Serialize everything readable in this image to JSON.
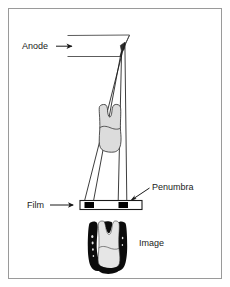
{
  "figure": {
    "background_color": "#ffffff",
    "frame_color": "#9a9a9a",
    "line_color": "#1a1a1a",
    "tooth_fill_color": "#dcdcdc",
    "penumbra_color": "#000000",
    "film_fill_color": "#ffffff"
  },
  "labels": {
    "anode": "Anode",
    "film": "Film",
    "penumbra": "Penumbra",
    "image": "Image"
  },
  "icons": {
    "anode_arrow": "arrow-right-icon",
    "film_arrow": "arrow-right-icon",
    "penumbra_arrow": "arrow-down-left-icon"
  },
  "parts": {
    "anode_target": "anode-focal-spot",
    "beam_left": "beam-edge-left",
    "beam_right": "beam-edge-right",
    "tooth": "tooth-object",
    "film_strip": "film-strip",
    "penumbra_left": "penumbra-band-left",
    "penumbra_right": "penumbra-band-right",
    "radiograph": "radiograph-image"
  }
}
